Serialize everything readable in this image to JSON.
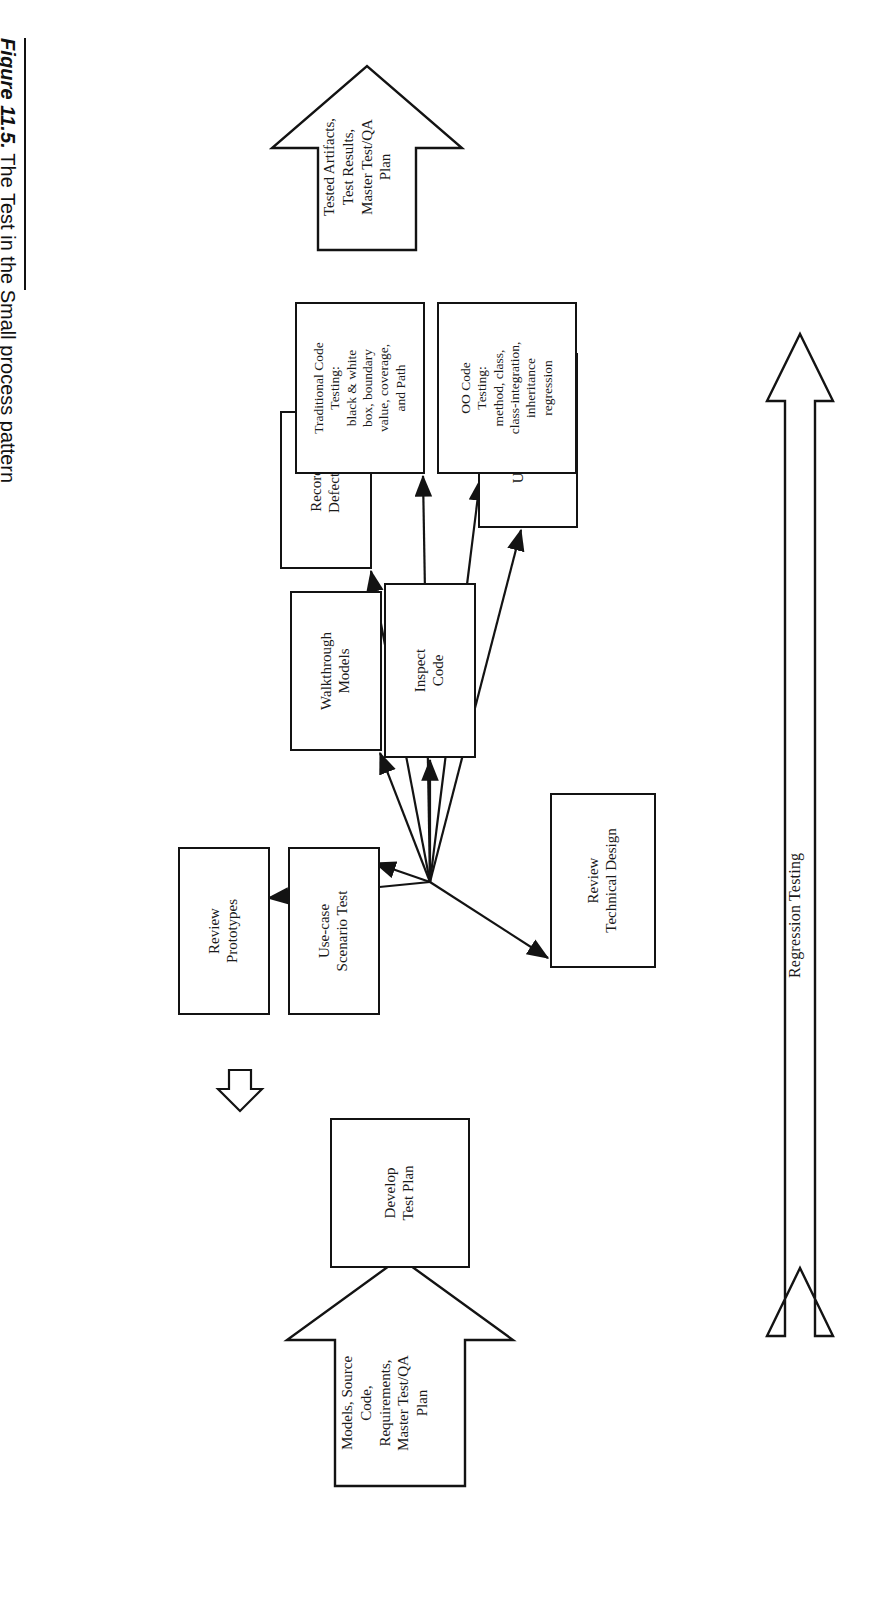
{
  "figure": {
    "number": "Figure 11.5.",
    "caption": "The Test in the Small process pattern"
  },
  "diagram": {
    "title": "Test in the Small process pattern",
    "input_arrow": {
      "name": "input-block-arrow",
      "label": "Models, Source\nCode,\nRequirements,\nMaster Test/QA\nPlan"
    },
    "output_arrow": {
      "name": "output-block-arrow",
      "label": "Tested Artifacts,\nTest Results,\nMaster Test/QA\nPlan"
    },
    "regression": {
      "label": "Regression Testing"
    },
    "start_box": {
      "label": "Develop\nTest Plan"
    },
    "hub": {
      "label": ""
    },
    "nodes": [
      {
        "id": "record-defects",
        "label": "Record\nDefects"
      },
      {
        "id": "walkthrough-models",
        "label": "Walkthrough\nModels"
      },
      {
        "id": "review-prototypes",
        "label": "Review\nPrototypes"
      },
      {
        "id": "use-case-scenario-test",
        "label": "Use-case\nScenario Test"
      },
      {
        "id": "review-technical-design",
        "label": "Review\nTechnical Design"
      },
      {
        "id": "inspect-code",
        "label": "Inspect\nCode"
      },
      {
        "id": "user-interface-testing",
        "label": "User Interface\nTesting"
      },
      {
        "id": "traditional-code-testing",
        "label": "Traditional Code\nTesting:\nblack & white\nbox, boundary\nvalue, coverage,\nand Path"
      },
      {
        "id": "oo-code-testing",
        "label": "OO Code\nTesting:\nmethod, class,\nclass-integration,\ninheritance\nregression"
      }
    ]
  },
  "colors": {
    "stroke": "#131313",
    "background": "#ffffff",
    "text": "#1a1a1a"
  }
}
